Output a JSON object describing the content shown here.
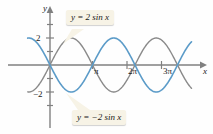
{
  "figure": {
    "background_color": "#fefefe",
    "axis_color": "#808080",
    "text_color": "#1a1a1a"
  },
  "axes": {
    "y_axis_label": "y",
    "x_axis_label": "x",
    "y_ticks": [
      {
        "label": "2",
        "value": 2
      },
      {
        "label": "−2",
        "value": -2
      }
    ],
    "x_ticks": [
      {
        "label": "π",
        "value": 3.14159
      },
      {
        "label": "2π",
        "value": 6.28319
      },
      {
        "label": "3π",
        "value": 9.42478
      }
    ]
  },
  "callouts": [
    {
      "name": "callout-2sinx",
      "text": "y = 2 sin x",
      "series": "2 sin x",
      "box_color": "#f7f3e6"
    },
    {
      "name": "callout-neg2sinx",
      "text": "y = −2 sin x",
      "series": "−2 sin x",
      "box_color": "#f7f3e6"
    }
  ],
  "chart_data": {
    "type": "line",
    "title": "",
    "xlabel": "x",
    "ylabel": "y",
    "xlim": [
      -1.65,
      11.4
    ],
    "ylim": [
      -2.85,
      2.85
    ],
    "grid": false,
    "legend_position": "callouts-on-plot",
    "x_tick_values": [
      3.14159,
      6.28319,
      9.42478
    ],
    "x_tick_labels": [
      "π",
      "2π",
      "3π"
    ],
    "y_tick_values": [
      2,
      -2
    ],
    "y_tick_labels": [
      "2",
      "−2"
    ],
    "series": [
      {
        "name": "2 sin x",
        "equation": "y = 2 sin x",
        "color": "#8a8a8a",
        "amplitude": 2,
        "period": 6.28319,
        "phase": 0,
        "linewidth": 1.4
      },
      {
        "name": "−2 sin x",
        "equation": "y = −2 sin x",
        "color": "#5b9bc8",
        "amplitude": -2,
        "period": 6.28319,
        "phase": 0,
        "linewidth": 1.6
      }
    ]
  }
}
